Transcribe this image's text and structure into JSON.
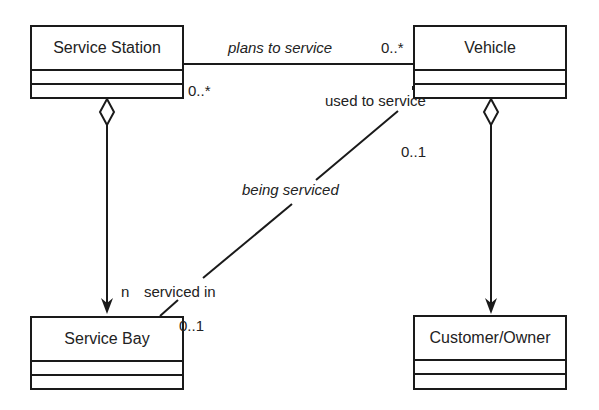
{
  "diagram": {
    "type": "UML class diagram",
    "classes": [
      {
        "id": "service_station",
        "name": "Service Station"
      },
      {
        "id": "vehicle",
        "name": "Vehicle"
      },
      {
        "id": "service_bay",
        "name": "Service Bay"
      },
      {
        "id": "customer_owner",
        "name": "Customer/Owner"
      }
    ],
    "associations": [
      {
        "from": "service_station",
        "to": "vehicle",
        "label": "plans to service",
        "source_multiplicity": "0..*",
        "target_multiplicity": "0..*"
      },
      {
        "from": "vehicle",
        "to": "service_bay",
        "label": "being serviced",
        "source_role": "used to service",
        "source_multiplicity": "0..1",
        "target_role": "serviced in",
        "target_multiplicity": "0..1"
      },
      {
        "from": "service_station",
        "to": "service_bay",
        "kind": "aggregation",
        "target_multiplicity": "n"
      },
      {
        "from": "vehicle",
        "to": "customer_owner",
        "kind": "aggregation"
      }
    ]
  },
  "labels": {
    "plans_to_service": "plans to service",
    "mult_vehicle_top": "0..*",
    "mult_station_right": "0..*",
    "used_to_service": "used to service",
    "mult_vehicle_01": "0..1",
    "being_serviced": "being serviced",
    "n": "n",
    "serviced_in": "serviced in",
    "mult_bay_01": "0..1"
  }
}
